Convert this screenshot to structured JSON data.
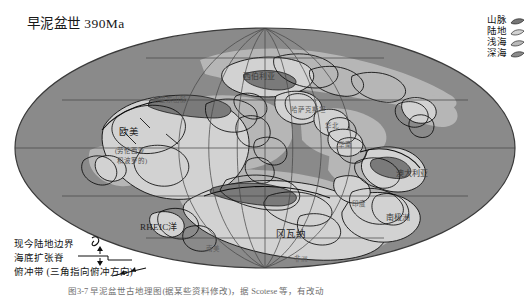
{
  "figure": {
    "title": "早泥盆世 390Ma",
    "caption": "图3-7  早泥盆世古地理图(据某些资料修改)，据 Scotese 等，有改动"
  },
  "colors": {
    "background": "#ffffff",
    "deep_sea": "#8a8a8a",
    "shallow_sea": "#b9b9b9",
    "land": "#d2d2d2",
    "mountain": "#767676",
    "coastline": "#111111",
    "graticule": "#4a4a4a",
    "outline": "#3a3a3a"
  },
  "legend_top_right": {
    "items": [
      {
        "label": "山脉",
        "swatch": "mountain",
        "color": "#767676"
      },
      {
        "label": "陆地",
        "swatch": "land",
        "color": "#d2d2d2"
      },
      {
        "label": "浅海",
        "swatch": "shallow-sea",
        "color": "#b9b9b9"
      },
      {
        "label": "深海",
        "swatch": "deep-sea",
        "color": "#8a8a8a"
      }
    ]
  },
  "legend_bottom_left": {
    "items": [
      {
        "label": "现今陆地边界",
        "symbol": "present-land-boundary-line"
      },
      {
        "label": "海底扩张脊",
        "symbol": "spreading-ridge-arrows"
      },
      {
        "label": "俯冲带 (三角指向俯冲方向)",
        "symbol": "subduction-zone-teeth"
      }
    ]
  },
  "map_labels": [
    {
      "text": "西伯利亚",
      "x": 243,
      "y": 70,
      "size": "mid"
    },
    {
      "text": "加里东山脉",
      "x": 152,
      "y": 94,
      "size": "faint"
    },
    {
      "text": "哈萨克斯坦",
      "x": 291,
      "y": 104,
      "size": "faint"
    },
    {
      "text": "欧美",
      "x": 119,
      "y": 124,
      "size": "big"
    },
    {
      "text": "(劳伦西亚",
      "x": 115,
      "y": 145,
      "size": "sml"
    },
    {
      "text": "和波罗的)",
      "x": 117,
      "y": 155,
      "size": "sml"
    },
    {
      "text": "华北",
      "x": 325,
      "y": 120,
      "size": "faint"
    },
    {
      "text": "华南",
      "x": 338,
      "y": 139,
      "size": "faint"
    },
    {
      "text": "澳大利亚",
      "x": 396,
      "y": 167,
      "size": "mid"
    },
    {
      "text": "南极洲",
      "x": 386,
      "y": 211,
      "size": "mid"
    },
    {
      "text": "RHEIC洋",
      "x": 140,
      "y": 220,
      "size": "ocean"
    },
    {
      "text": "冈瓦纳",
      "x": 276,
      "y": 226,
      "size": "big"
    },
    {
      "text": "南美",
      "x": 206,
      "y": 243,
      "size": "faint"
    },
    {
      "text": "非洲",
      "x": 294,
      "y": 253,
      "size": "faint"
    },
    {
      "text": "印度",
      "x": 352,
      "y": 198,
      "size": "faint"
    }
  ],
  "projection": {
    "type": "mollweide-oval",
    "center_x": 265,
    "center_y": 148,
    "radius_x": 250,
    "radius_y": 120,
    "meridian_count": 7,
    "parallel_count": 5
  }
}
